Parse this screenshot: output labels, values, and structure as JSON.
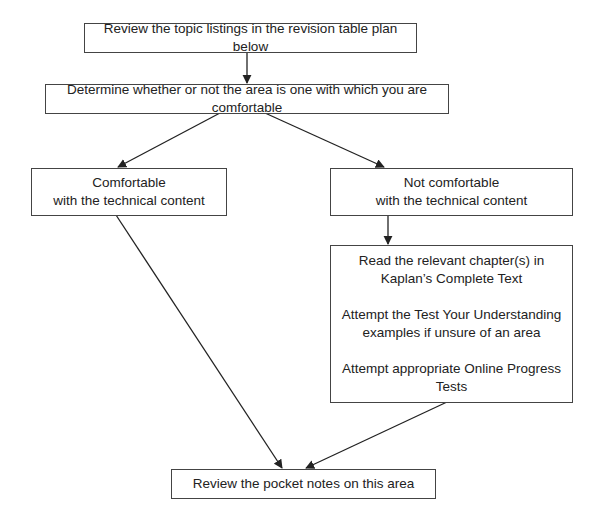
{
  "diagram": {
    "type": "flowchart",
    "nodes": {
      "review_topics": {
        "label": "Review the topic listings in the revision table plan below"
      },
      "determine": {
        "label": "Determine whether or not the area is one with which you are comfortable"
      },
      "comfortable": {
        "line1": "Comfortable",
        "line2": "with the technical content"
      },
      "not_comfortable": {
        "line1": "Not comfortable",
        "line2": "with the technical content"
      },
      "actions": {
        "step1_line1": "Read the relevant chapter(s) in",
        "step1_line2": "Kaplan’s Complete Text",
        "step2_line1": "Attempt the Test Your Understanding",
        "step2_line2": "examples if unsure of an area",
        "step3_line1": "Attempt appropriate Online Progress",
        "step3_line2": "Tests"
      },
      "pocket_notes": {
        "label": "Review the pocket notes on this area"
      }
    },
    "edges": [
      {
        "from": "review_topics",
        "to": "determine"
      },
      {
        "from": "determine",
        "to": "comfortable"
      },
      {
        "from": "determine",
        "to": "not_comfortable"
      },
      {
        "from": "not_comfortable",
        "to": "actions"
      },
      {
        "from": "comfortable",
        "to": "pocket_notes"
      },
      {
        "from": "actions",
        "to": "pocket_notes"
      }
    ],
    "colors": {
      "stroke": "#444444",
      "text": "#222222",
      "background": "#ffffff"
    }
  }
}
